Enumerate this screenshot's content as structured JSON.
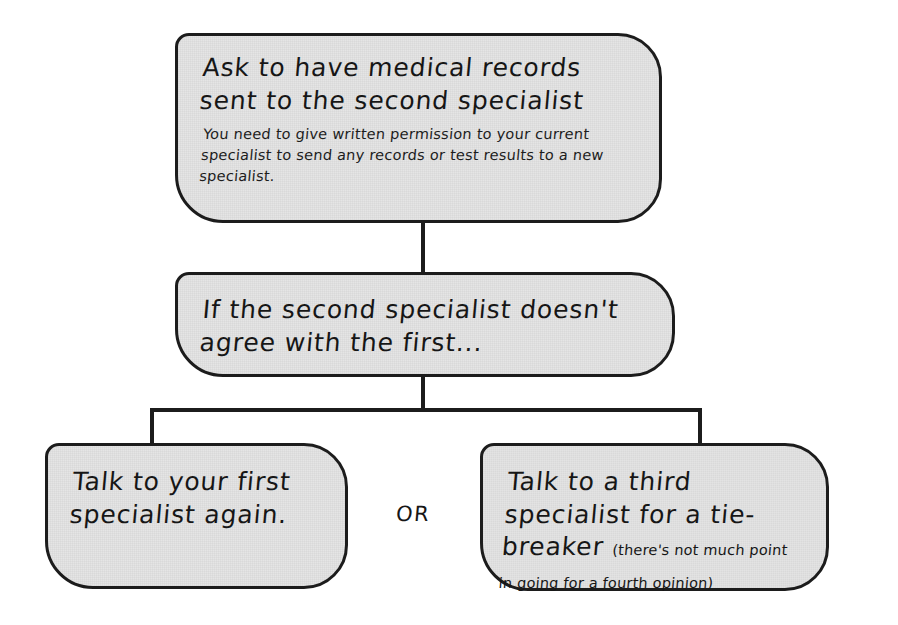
{
  "diagram": {
    "type": "flowchart",
    "colors": {
      "node_fill": "#e3e3e3",
      "node_border": "#1c1c1c",
      "connector": "#1c1c1c",
      "text": "#161616",
      "page_background": "#ffffff"
    },
    "nodes": [
      {
        "id": "records",
        "heading": "Ask to have medical records sent to the second specialist",
        "body": "You need to give written permission to your current specialist to send any records or test results to a new specialist.",
        "aside": ""
      },
      {
        "id": "disagree",
        "heading": "If the second specialist doesn't agree with the first...",
        "body": "",
        "aside": ""
      },
      {
        "id": "first-again",
        "heading": "Talk to your first specialist again.",
        "body": "",
        "aside": ""
      },
      {
        "id": "third-specialist",
        "heading": "Talk to a third specialist for a tie-breaker ",
        "body": "",
        "aside": "(there's not much point in going for a fourth opinion)"
      }
    ],
    "branch_label": "OR",
    "edges": [
      {
        "from": "records",
        "to": "disagree",
        "kind": "vertical"
      },
      {
        "from": "disagree",
        "to": "first-again",
        "kind": "split-left"
      },
      {
        "from": "disagree",
        "to": "third-specialist",
        "kind": "split-right"
      }
    ]
  }
}
